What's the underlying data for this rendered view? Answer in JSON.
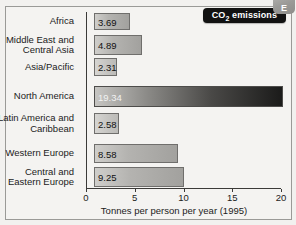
{
  "badge": {
    "corner_letter": "E",
    "title": "CO₂ emissions",
    "title_plain": "CO2 emissions"
  },
  "chart_data": {
    "type": "bar",
    "orientation": "horizontal",
    "xlabel": "Tonnes per person per year (1995)",
    "ylabel": "",
    "xlim": [
      0,
      20
    ],
    "xticks": [
      0,
      5,
      10,
      15,
      20
    ],
    "xtick_labels": [
      "0",
      "5",
      "10",
      "15",
      "20"
    ],
    "grid": false,
    "legend": false,
    "categories": [
      "Africa",
      "Middle East and\nCentral Asia",
      "Asia/Pacific",
      "North America",
      "Latin America and\nCaribbean",
      "Western Europe",
      "Central and\nEastern Europe"
    ],
    "values": [
      3.69,
      4.89,
      2.31,
      19.34,
      2.58,
      8.58,
      9.25
    ],
    "value_labels": [
      "3.69",
      "4.89",
      "2.31",
      "19.34",
      "2.58",
      "8.58",
      "9.25"
    ],
    "bar_styles": [
      "mid",
      "mid",
      "light",
      "dark",
      "light",
      "mid",
      "mid"
    ]
  },
  "colors": {
    "page_background": "#f2f1ef",
    "panel_background": "#f4f3f1",
    "frame_border": "#9a9a97",
    "badge_background": "#121212",
    "badge_text": "#ffffff",
    "axis": "#3b3a38",
    "text": "#1b1b1b",
    "bar_light": "#cfcecb",
    "bar_dark": "#1b1b1a",
    "corner_tab": "#9b9a97"
  }
}
